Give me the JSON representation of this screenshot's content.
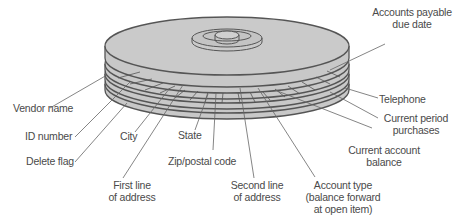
{
  "diagram": {
    "colors": {
      "disk_fill": "#c8c8c8",
      "disk_edge": "#555555",
      "leader": "#666666",
      "text": "#4a4a4a",
      "background": "#ffffff"
    }
  },
  "labels": {
    "accounts_payable_due_date": {
      "line1": "Accounts payable",
      "line2": "due date"
    },
    "telephone": "Telephone",
    "current_period_purchases": {
      "line1": "Current period",
      "line2": "purchases"
    },
    "current_account_balance": {
      "line1": "Current account",
      "line2": "balance"
    },
    "vendor_name": "Vendor name",
    "id_number": "ID number",
    "delete_flag": "Delete flag",
    "city": "City",
    "state": "State",
    "zip_postal_code": "Zip/postal code",
    "first_line_of_address": {
      "line1": "First line",
      "line2": "of address"
    },
    "second_line_of_address": {
      "line1": "Second line",
      "line2": "of address"
    },
    "account_type": {
      "line1": "Account type",
      "line2": "(balance forward",
      "line3": "at open item)"
    }
  }
}
